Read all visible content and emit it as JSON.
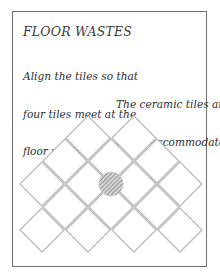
{
  "diagram": {
    "title": "FLOOR WASTES",
    "annotations": [
      {
        "id": "align",
        "lines": [
          "Align the tiles so that",
          "four tiles meet at the",
          "floor waste"
        ]
      },
      {
        "id": "cut",
        "lines": [
          "The ceramic tiles are",
          "cut to accommodate",
          "the waste"
        ]
      }
    ],
    "tile_rows": [
      2,
      3,
      4,
      3,
      4
    ],
    "elements": {
      "tiles": "ceramic tiles laid diagonally",
      "drain": "floor waste (hatched circle)"
    },
    "colors": {
      "frame": "#6e6e6e",
      "tile_outline": "#bdbdbd",
      "tile_grout": "#a8a8a8",
      "drain_hatch": "#7a7a7a",
      "text": "#2e2e2e"
    }
  }
}
